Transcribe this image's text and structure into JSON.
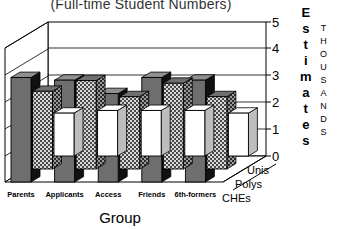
{
  "chart_data": {
    "type": "bar",
    "title": "(Full-time Student Numbers)",
    "xlabel": "Group",
    "ylabel": "Estimates",
    "yunit": "THOUSANDS",
    "categories": [
      "Parents",
      "Applicants",
      "Access",
      "Friends",
      "6th-formers"
    ],
    "ylim": [
      0,
      5
    ],
    "yticks": [
      "0",
      "1",
      "2",
      "3",
      "4",
      "5"
    ],
    "grid": true,
    "legend_position": "depth-axis",
    "projection": "3d",
    "series": [
      {
        "name": "Unis",
        "values": [
          1.6,
          1.7,
          1.7,
          1.7,
          1.6
        ],
        "color": "#ffffff",
        "fill": "solid"
      },
      {
        "name": "Polys",
        "values": [
          2.9,
          3.3,
          2.7,
          3.2,
          2.7
        ],
        "color": "#9a9a9a",
        "fill": "checker"
      },
      {
        "name": "CHEs",
        "values": [
          3.9,
          3.8,
          3.3,
          3.9,
          3.8
        ],
        "color": "#6e6e6e",
        "fill": "solid"
      }
    ]
  },
  "axis": {
    "y_title_letters": [
      "E",
      "s",
      "t",
      "i",
      "m",
      "a",
      "t",
      "e",
      "s"
    ],
    "y_unit_letters": [
      "T",
      "H",
      "O",
      "U",
      "S",
      "A",
      "N",
      "D",
      "S"
    ]
  }
}
